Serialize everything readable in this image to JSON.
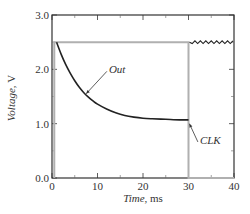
{
  "chart_data": {
    "type": "line",
    "title": "",
    "xlabel_italic": "Time",
    "xlabel_unit": ", ms",
    "ylabel_italic": "Voltage",
    "ylabel_unit": ", V",
    "xlim": [
      0,
      40
    ],
    "ylim": [
      0.0,
      3.0
    ],
    "x_ticks": [
      0,
      10,
      20,
      30,
      40
    ],
    "x_tick_labels": [
      "0",
      "10",
      "20",
      "30",
      "40"
    ],
    "y_ticks": [
      0.0,
      1.0,
      2.0,
      3.0
    ],
    "y_tick_labels": [
      "0.0",
      "1.0",
      "2.0",
      "3.0"
    ],
    "grid": false,
    "legend": null,
    "series": [
      {
        "name": "Out",
        "color": "#222222",
        "x": [
          1,
          2,
          3,
          4,
          5,
          6,
          7,
          8,
          9,
          10,
          12,
          14,
          16,
          18,
          20,
          22,
          25,
          28,
          30
        ],
        "y": [
          2.5,
          2.28,
          2.09,
          1.93,
          1.79,
          1.67,
          1.57,
          1.49,
          1.42,
          1.36,
          1.27,
          1.2,
          1.15,
          1.12,
          1.1,
          1.09,
          1.08,
          1.07,
          1.07
        ]
      },
      {
        "name": "Out (after CLK, ripple)",
        "color": "#222222",
        "x": [
          30,
          40
        ],
        "y": [
          2.5,
          2.5
        ]
      },
      {
        "name": "CLK",
        "color": "#b0b0b0",
        "x": [
          0.5,
          0.5,
          30,
          30,
          40
        ],
        "y": [
          0.0,
          2.5,
          2.5,
          0.0,
          0.0
        ]
      }
    ],
    "annotations": [
      {
        "text": "Out",
        "x": 12.5,
        "y": 2.0,
        "arrow_to": [
          7.5,
          1.55
        ]
      },
      {
        "text": "CLK",
        "x": 32.5,
        "y": 0.7,
        "arrow_to": [
          30.2,
          1.0
        ]
      }
    ]
  }
}
